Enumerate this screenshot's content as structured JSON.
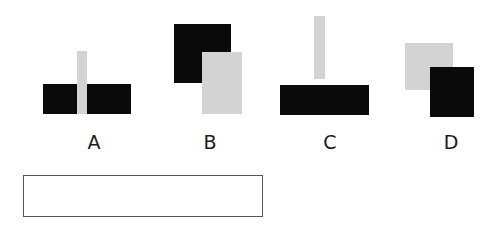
{
  "colors": {
    "dark": "#0a0a0a",
    "light": "#d3d3d3",
    "border": "#555555"
  },
  "options": [
    {
      "label": "A",
      "label_pos": [
        94,
        142
      ],
      "shapes": [
        {
          "kind": "dark",
          "x": 43,
          "y": 84,
          "w": 34,
          "h": 30
        },
        {
          "kind": "dark",
          "x": 87,
          "y": 84,
          "w": 44,
          "h": 30
        },
        {
          "kind": "light",
          "x": 77,
          "y": 51,
          "w": 10,
          "h": 63
        }
      ]
    },
    {
      "label": "B",
      "label_pos": [
        210,
        142
      ],
      "shapes": [
        {
          "kind": "dark",
          "x": 174,
          "y": 24,
          "w": 57,
          "h": 59
        },
        {
          "kind": "light",
          "x": 202,
          "y": 52,
          "w": 40,
          "h": 62
        }
      ]
    },
    {
      "label": "C",
      "label_pos": [
        330,
        142
      ],
      "shapes": [
        {
          "kind": "light",
          "x": 314,
          "y": 16,
          "w": 11,
          "h": 63
        },
        {
          "kind": "dark",
          "x": 280,
          "y": 85,
          "w": 89,
          "h": 30
        }
      ]
    },
    {
      "label": "D",
      "label_pos": [
        451,
        142
      ],
      "shapes": [
        {
          "kind": "light",
          "x": 405,
          "y": 43,
          "w": 48,
          "h": 47
        },
        {
          "kind": "dark",
          "x": 430,
          "y": 67,
          "w": 44,
          "h": 50
        }
      ]
    }
  ],
  "answer_box": {
    "x": 23,
    "y": 175,
    "w": 240,
    "h": 42,
    "value": ""
  }
}
